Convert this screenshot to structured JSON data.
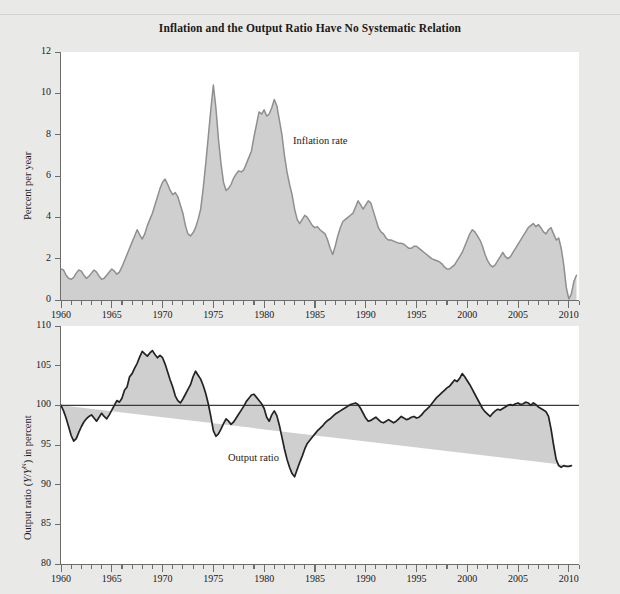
{
  "figure": {
    "title": "Inflation and the Output Ratio Have No Systematic Relation",
    "background_color": "#e9e9e7",
    "plot_background_color": "#ffffff",
    "fill_color": "#cfcfcf",
    "line_color": "#8a8a8a",
    "axis_color": "#6d6d6d"
  },
  "chart_data": [
    {
      "type": "area",
      "id": "inflation-panel",
      "title": "",
      "series_label": "Inflation rate",
      "xlabel": "",
      "ylabel": "Percent per year",
      "xlim": [
        1960,
        2011
      ],
      "ylim": [
        0,
        12
      ],
      "yticks": [
        0,
        2,
        4,
        6,
        8,
        10,
        12
      ],
      "ytick_labels": [
        "0",
        "2",
        "4",
        "6",
        "8",
        "10",
        "12"
      ],
      "xticks": [
        1960,
        1965,
        1970,
        1975,
        1980,
        1985,
        1990,
        1995,
        2000,
        2005,
        2010
      ],
      "xtick_labels": [
        "1960",
        "1965",
        "1970",
        "1975",
        "1980",
        "1985",
        "1990",
        "1995",
        "2000",
        "2005",
        "2010"
      ],
      "minor_xtick_interval": 1,
      "grid": false,
      "legend": "inline-annotation",
      "baseline": 0,
      "x": [
        1960.0,
        1960.25,
        1960.5,
        1960.75,
        1961.0,
        1961.25,
        1961.5,
        1961.75,
        1962.0,
        1962.25,
        1962.5,
        1962.75,
        1963.0,
        1963.25,
        1963.5,
        1963.75,
        1964.0,
        1964.25,
        1964.5,
        1964.75,
        1965.0,
        1965.25,
        1965.5,
        1965.75,
        1966.0,
        1966.25,
        1966.5,
        1966.75,
        1967.0,
        1967.25,
        1967.5,
        1967.75,
        1968.0,
        1968.25,
        1968.5,
        1968.75,
        1969.0,
        1969.25,
        1969.5,
        1969.75,
        1970.0,
        1970.25,
        1970.5,
        1970.75,
        1971.0,
        1971.25,
        1971.5,
        1971.75,
        1972.0,
        1972.25,
        1972.5,
        1972.75,
        1973.0,
        1973.25,
        1973.5,
        1973.75,
        1974.0,
        1974.25,
        1974.5,
        1974.75,
        1975.0,
        1975.25,
        1975.5,
        1975.75,
        1976.0,
        1976.25,
        1976.5,
        1976.75,
        1977.0,
        1977.25,
        1977.5,
        1977.75,
        1978.0,
        1978.25,
        1978.5,
        1978.75,
        1979.0,
        1979.25,
        1979.5,
        1979.75,
        1980.0,
        1980.25,
        1980.5,
        1980.75,
        1981.0,
        1981.25,
        1981.5,
        1981.75,
        1982.0,
        1982.25,
        1982.5,
        1982.75,
        1983.0,
        1983.25,
        1983.5,
        1983.75,
        1984.0,
        1984.25,
        1984.5,
        1984.75,
        1985.0,
        1985.25,
        1985.5,
        1985.75,
        1986.0,
        1986.25,
        1986.5,
        1986.75,
        1987.0,
        1987.25,
        1987.5,
        1987.75,
        1988.0,
        1988.25,
        1988.5,
        1988.75,
        1989.0,
        1989.25,
        1989.5,
        1989.75,
        1990.0,
        1990.25,
        1990.5,
        1990.75,
        1991.0,
        1991.25,
        1991.5,
        1991.75,
        1992.0,
        1992.25,
        1992.5,
        1992.75,
        1993.0,
        1993.25,
        1993.5,
        1993.75,
        1994.0,
        1994.25,
        1994.5,
        1994.75,
        1995.0,
        1995.25,
        1995.5,
        1995.75,
        1996.0,
        1996.25,
        1996.5,
        1996.75,
        1997.0,
        1997.25,
        1997.5,
        1997.75,
        1998.0,
        1998.25,
        1998.5,
        1998.75,
        1999.0,
        1999.25,
        1999.5,
        1999.75,
        2000.0,
        2000.25,
        2000.5,
        2000.75,
        2001.0,
        2001.25,
        2001.5,
        2001.75,
        2002.0,
        2002.25,
        2002.5,
        2002.75,
        2003.0,
        2003.25,
        2003.5,
        2003.75,
        2004.0,
        2004.25,
        2004.5,
        2004.75,
        2005.0,
        2005.25,
        2005.5,
        2005.75,
        2006.0,
        2006.25,
        2006.5,
        2006.75,
        2007.0,
        2007.25,
        2007.5,
        2007.75,
        2008.0,
        2008.25,
        2008.5,
        2008.75,
        2009.0,
        2009.25,
        2009.5,
        2009.75,
        2010.0,
        2010.25,
        2010.5,
        2010.75
      ],
      "y": [
        1.5,
        1.45,
        1.2,
        1.05,
        1.0,
        1.1,
        1.3,
        1.45,
        1.4,
        1.2,
        1.05,
        1.15,
        1.3,
        1.45,
        1.35,
        1.15,
        1.0,
        1.05,
        1.2,
        1.35,
        1.5,
        1.4,
        1.25,
        1.35,
        1.6,
        1.9,
        2.2,
        2.5,
        2.8,
        3.1,
        3.4,
        3.15,
        2.95,
        3.2,
        3.6,
        3.9,
        4.2,
        4.6,
        5.0,
        5.4,
        5.7,
        5.85,
        5.6,
        5.3,
        5.1,
        5.2,
        5.0,
        4.6,
        4.2,
        3.6,
        3.2,
        3.1,
        3.25,
        3.5,
        3.9,
        4.4,
        5.4,
        6.6,
        7.9,
        9.2,
        10.4,
        9.3,
        7.8,
        6.6,
        5.7,
        5.3,
        5.4,
        5.6,
        5.9,
        6.1,
        6.25,
        6.2,
        6.3,
        6.6,
        6.9,
        7.2,
        7.9,
        8.5,
        9.1,
        9.0,
        9.2,
        8.9,
        9.0,
        9.3,
        9.7,
        9.4,
        8.7,
        8.0,
        7.0,
        6.2,
        5.6,
        5.1,
        4.4,
        3.9,
        3.7,
        3.9,
        4.1,
        4.0,
        3.8,
        3.6,
        3.5,
        3.55,
        3.4,
        3.3,
        3.2,
        2.9,
        2.5,
        2.2,
        2.6,
        3.1,
        3.5,
        3.8,
        3.9,
        4.0,
        4.1,
        4.2,
        4.5,
        4.8,
        4.6,
        4.4,
        4.6,
        4.8,
        4.7,
        4.3,
        3.9,
        3.5,
        3.3,
        3.2,
        3.0,
        2.9,
        2.9,
        2.85,
        2.8,
        2.75,
        2.75,
        2.7,
        2.6,
        2.5,
        2.5,
        2.6,
        2.6,
        2.5,
        2.4,
        2.3,
        2.2,
        2.1,
        2.0,
        1.95,
        1.9,
        1.85,
        1.75,
        1.6,
        1.5,
        1.5,
        1.6,
        1.7,
        1.9,
        2.1,
        2.3,
        2.6,
        2.9,
        3.2,
        3.4,
        3.3,
        3.1,
        2.9,
        2.6,
        2.2,
        1.9,
        1.7,
        1.6,
        1.7,
        1.9,
        2.1,
        2.3,
        2.1,
        2.0,
        2.1,
        2.3,
        2.5,
        2.7,
        2.9,
        3.1,
        3.3,
        3.5,
        3.6,
        3.7,
        3.55,
        3.65,
        3.5,
        3.3,
        3.2,
        3.4,
        3.5,
        3.2,
        2.9,
        3.0,
        2.5,
        1.7,
        0.6,
        0.05,
        0.3,
        0.9,
        1.2,
        1.0,
        1.1,
        1.5
      ]
    },
    {
      "type": "area",
      "id": "output-ratio-panel",
      "title": "",
      "series_label": "Output ratio",
      "xlabel": "",
      "ylabel": "Output ratio (Y/Y^N) in percent",
      "xlim": [
        1960,
        2011
      ],
      "ylim": [
        80,
        110
      ],
      "yticks": [
        80,
        85,
        90,
        95,
        100,
        105,
        110
      ],
      "ytick_labels": [
        "80",
        "85",
        "90",
        "95",
        "100",
        "105",
        "110"
      ],
      "xticks": [
        1960,
        1965,
        1970,
        1975,
        1980,
        1985,
        1990,
        1995,
        2000,
        2005,
        2010
      ],
      "xtick_labels": [
        "1960",
        "1965",
        "1970",
        "1975",
        "1980",
        "1985",
        "1990",
        "1995",
        "2000",
        "2005",
        "2010"
      ],
      "minor_xtick_interval": 1,
      "grid": false,
      "legend": "inline-annotation",
      "baseline": 100,
      "x": [
        1960.0,
        1960.25,
        1960.5,
        1960.75,
        1961.0,
        1961.25,
        1961.5,
        1961.75,
        1962.0,
        1962.25,
        1962.5,
        1962.75,
        1963.0,
        1963.25,
        1963.5,
        1963.75,
        1964.0,
        1964.25,
        1964.5,
        1964.75,
        1965.0,
        1965.25,
        1965.5,
        1965.75,
        1966.0,
        1966.25,
        1966.5,
        1966.75,
        1967.0,
        1967.25,
        1967.5,
        1967.75,
        1968.0,
        1968.25,
        1968.5,
        1968.75,
        1969.0,
        1969.25,
        1969.5,
        1969.75,
        1970.0,
        1970.25,
        1970.5,
        1970.75,
        1971.0,
        1971.25,
        1971.5,
        1971.75,
        1972.0,
        1972.25,
        1972.5,
        1972.75,
        1973.0,
        1973.25,
        1973.5,
        1973.75,
        1974.0,
        1974.25,
        1974.5,
        1974.75,
        1975.0,
        1975.25,
        1975.5,
        1975.75,
        1976.0,
        1976.25,
        1976.5,
        1976.75,
        1977.0,
        1977.25,
        1977.5,
        1977.75,
        1978.0,
        1978.25,
        1978.5,
        1978.75,
        1979.0,
        1979.25,
        1979.5,
        1979.75,
        1980.0,
        1980.25,
        1980.5,
        1980.75,
        1981.0,
        1981.25,
        1981.5,
        1981.75,
        1982.0,
        1982.25,
        1982.5,
        1982.75,
        1983.0,
        1983.25,
        1983.5,
        1983.75,
        1984.0,
        1984.25,
        1984.5,
        1984.75,
        1985.0,
        1985.25,
        1985.5,
        1985.75,
        1986.0,
        1986.25,
        1986.5,
        1986.75,
        1987.0,
        1987.25,
        1987.5,
        1987.75,
        1988.0,
        1988.25,
        1988.5,
        1988.75,
        1989.0,
        1989.25,
        1989.5,
        1989.75,
        1990.0,
        1990.25,
        1990.5,
        1990.75,
        1991.0,
        1991.25,
        1991.5,
        1991.75,
        1992.0,
        1992.25,
        1992.5,
        1992.75,
        1993.0,
        1993.25,
        1993.5,
        1993.75,
        1994.0,
        1994.25,
        1994.5,
        1994.75,
        1995.0,
        1995.25,
        1995.5,
        1995.75,
        1996.0,
        1996.25,
        1996.5,
        1996.75,
        1997.0,
        1997.25,
        1997.5,
        1997.75,
        1998.0,
        1998.25,
        1998.5,
        1998.75,
        1999.0,
        1999.25,
        1999.5,
        1999.75,
        2000.0,
        2000.25,
        2000.5,
        2000.75,
        2001.0,
        2001.25,
        2001.5,
        2001.75,
        2002.0,
        2002.25,
        2002.5,
        2002.75,
        2003.0,
        2003.25,
        2003.5,
        2003.75,
        2004.0,
        2004.25,
        2004.5,
        2004.75,
        2005.0,
        2005.25,
        2005.5,
        2005.75,
        2006.0,
        2006.25,
        2006.5,
        2006.75,
        2007.0,
        2007.25,
        2007.5,
        2007.75,
        2008.0,
        2008.25,
        2008.5,
        2008.75,
        2009.0,
        2009.25,
        2009.5,
        2009.75,
        2010.0,
        2010.25,
        2010.5,
        2010.75
      ],
      "y": [
        100.0,
        99.3,
        98.4,
        97.3,
        96.2,
        95.5,
        95.8,
        96.6,
        97.3,
        97.9,
        98.3,
        98.6,
        98.8,
        98.4,
        98.0,
        98.5,
        99.0,
        98.6,
        98.3,
        98.8,
        99.4,
        100.0,
        100.6,
        100.4,
        100.9,
        101.9,
        102.3,
        103.6,
        104.0,
        104.7,
        105.3,
        106.1,
        106.8,
        106.5,
        106.2,
        106.6,
        106.9,
        106.4,
        106.0,
        106.3,
        106.0,
        105.2,
        104.2,
        103.2,
        102.3,
        101.2,
        100.6,
        100.3,
        100.8,
        101.4,
        102.0,
        102.6,
        103.6,
        104.3,
        103.8,
        103.3,
        102.5,
        101.5,
        100.2,
        98.6,
        96.8,
        96.1,
        96.4,
        97.0,
        97.7,
        98.3,
        98.0,
        97.6,
        97.9,
        98.4,
        98.9,
        99.4,
        99.9,
        100.5,
        100.9,
        101.3,
        101.4,
        101.0,
        100.6,
        100.2,
        99.6,
        98.5,
        98.0,
        98.8,
        99.3,
        98.7,
        97.5,
        96.0,
        94.5,
        93.2,
        92.2,
        91.4,
        91.0,
        91.9,
        92.8,
        93.6,
        94.5,
        95.2,
        95.6,
        96.0,
        96.4,
        96.8,
        97.1,
        97.4,
        97.8,
        98.1,
        98.3,
        98.6,
        98.9,
        99.1,
        99.3,
        99.5,
        99.7,
        99.9,
        100.1,
        100.2,
        100.3,
        100.1,
        99.6,
        99.0,
        98.4,
        98.0,
        98.1,
        98.3,
        98.5,
        98.2,
        97.9,
        97.8,
        98.0,
        98.2,
        98.0,
        97.8,
        98.0,
        98.3,
        98.6,
        98.4,
        98.2,
        98.3,
        98.5,
        98.6,
        98.4,
        98.5,
        98.8,
        99.2,
        99.5,
        99.8,
        100.2,
        100.6,
        101.0,
        101.3,
        101.6,
        101.9,
        102.2,
        102.4,
        102.8,
        103.2,
        103.0,
        103.4,
        104.0,
        103.6,
        103.1,
        102.6,
        102.0,
        101.4,
        100.8,
        100.2,
        99.6,
        99.2,
        98.9,
        98.6,
        99.0,
        99.3,
        99.5,
        99.4,
        99.6,
        99.8,
        100.0,
        100.1,
        100.0,
        100.2,
        100.3,
        100.1,
        100.2,
        100.4,
        100.3,
        100.0,
        100.3,
        100.1,
        99.8,
        99.6,
        99.4,
        99.2,
        98.6,
        97.0,
        95.0,
        93.2,
        92.4,
        92.2,
        92.4,
        92.3,
        92.3,
        92.4
      ]
    }
  ]
}
